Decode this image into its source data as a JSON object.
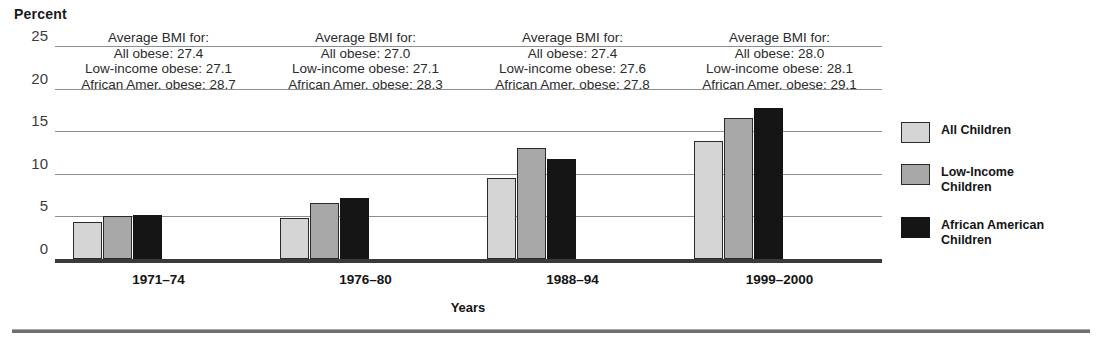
{
  "chart_data": {
    "type": "bar",
    "title": "",
    "ylabel": "Percent",
    "xlabel": "Years",
    "categories": [
      "1971–74",
      "1976–80",
      "1988–94",
      "1999–2000"
    ],
    "series": [
      {
        "name": "All Children",
        "color": "#d5d5d5",
        "values": [
          4.3,
          4.8,
          9.5,
          13.8
        ]
      },
      {
        "name": "Low-Income Children",
        "color": "#a8a8a8",
        "values": [
          5.1,
          6.6,
          13.0,
          16.6
        ]
      },
      {
        "name": "African American Children",
        "color": "#151515",
        "values": [
          5.2,
          7.2,
          11.7,
          17.7
        ]
      }
    ],
    "ylim": [
      0,
      25
    ],
    "yticks": [
      0,
      5,
      10,
      15,
      20,
      25
    ],
    "grid": true,
    "legend_position": "right",
    "annotations": [
      {
        "category": "1971–74",
        "header": "Average BMI for:",
        "all_obese": "All obese: 27.4",
        "low_income_obese": "Low-income obese: 27.1",
        "african_amer_obese": "African Amer. obese: 28.7"
      },
      {
        "category": "1976–80",
        "header": "Average BMI for:",
        "all_obese": "All obese: 27.0",
        "low_income_obese": "Low-income obese: 27.1",
        "african_amer_obese": "African Amer. obese: 28.3"
      },
      {
        "category": "1988–94",
        "header": "Average BMI for:",
        "all_obese": "All obese: 27.4",
        "low_income_obese": "Low-income obese: 27.6",
        "african_amer_obese": "African Amer. obese: 27.8"
      },
      {
        "category": "1999–2000",
        "header": "Average BMI for:",
        "all_obese": "All obese: 28.0",
        "low_income_obese": "Low-income obese: 28.1",
        "african_amer_obese": "African Amer. obese: 29.1"
      }
    ]
  },
  "axis": {
    "y_title": "Percent",
    "x_title": "Years",
    "yticks": [
      "25",
      "20",
      "15",
      "10",
      "5",
      "0"
    ]
  },
  "legend": {
    "items": [
      {
        "line1": "All Children",
        "line2": ""
      },
      {
        "line1": "Low-Income",
        "line2": "Children"
      },
      {
        "line1": "African American",
        "line2": "Children"
      }
    ]
  }
}
